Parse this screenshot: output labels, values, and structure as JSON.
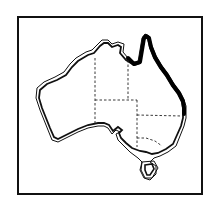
{
  "map": {
    "subject": "Australia",
    "type": "distribution-map",
    "colors": {
      "background": "#ffffff",
      "outline": "#111111",
      "highlight": "#000000"
    },
    "highlighted_region": "north-east coast (Queensland)",
    "features": [
      "coastline-double-outline",
      "state-borders-dashed",
      "tasmania"
    ]
  }
}
